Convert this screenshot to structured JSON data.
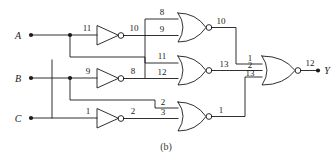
{
  "figure": {
    "caption": "(b)",
    "type": "logic-circuit-schematic"
  },
  "inputs": [
    {
      "name": "A",
      "y": 35
    },
    {
      "name": "B",
      "y": 78
    },
    {
      "name": "C",
      "y": 118
    }
  ],
  "output": {
    "name": "Y",
    "pin": "12"
  },
  "inverters": [
    {
      "id": "inv-a",
      "in_pin": "11",
      "out_pin": "10",
      "source": "A"
    },
    {
      "id": "inv-b",
      "in_pin": "9",
      "out_pin": "8",
      "source": "B"
    },
    {
      "id": "inv-c",
      "in_pin": "1",
      "out_pin": "2",
      "source": "C"
    }
  ],
  "gates": [
    {
      "id": "nor-top",
      "type": "NOR",
      "in_pins": [
        "8",
        "9"
      ],
      "out_pin": "10"
    },
    {
      "id": "nor-mid",
      "type": "NOR",
      "in_pins": [
        "11",
        "12"
      ],
      "out_pin": "13"
    },
    {
      "id": "nor-bot",
      "type": "NOR",
      "in_pins": [
        "2",
        "3"
      ],
      "out_pin": "1"
    },
    {
      "id": "nor-final",
      "type": "NOR",
      "in_pins": [
        "1",
        "2",
        "13"
      ],
      "out_pin": "12"
    }
  ],
  "pin_labels": {
    "a_in": "11",
    "a_inv_out": "10",
    "b_in": "9",
    "b_inv_out": "8",
    "c_in": "1",
    "c_inv_out": "2",
    "nor_top_in1": "8",
    "nor_top_in2": "9",
    "nor_top_out": "10",
    "nor_mid_in1": "11",
    "nor_mid_in2": "12",
    "nor_mid_out": "13",
    "nor_bot_in1": "2",
    "nor_bot_in2": "3",
    "nor_bot_out": "1",
    "nor_final_in1": "1",
    "nor_final_in2": "2",
    "nor_final_in3": "13",
    "nor_final_out": "12"
  },
  "colors": {
    "wire": "#1a1a1a",
    "background": "#ffffff",
    "text": "#1a1a1a"
  }
}
